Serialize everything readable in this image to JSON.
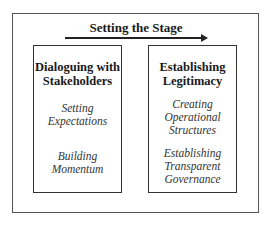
{
  "diagram": {
    "title": "Setting the Stage",
    "arrow_direction": "right",
    "boxes": [
      {
        "title_lines": [
          "Dialoguing with",
          "Stakeholders"
        ],
        "items": [
          {
            "lines": [
              "Setting",
              "Expectations"
            ]
          },
          {
            "lines": [
              "Building",
              "Momentum"
            ]
          }
        ]
      },
      {
        "title_lines": [
          "Establishing",
          "Legitimacy"
        ],
        "items": [
          {
            "lines": [
              "Creating",
              "Operational",
              "Structures"
            ]
          },
          {
            "lines": [
              "Establishing",
              "Transparent",
              "Governance"
            ]
          }
        ]
      }
    ]
  }
}
